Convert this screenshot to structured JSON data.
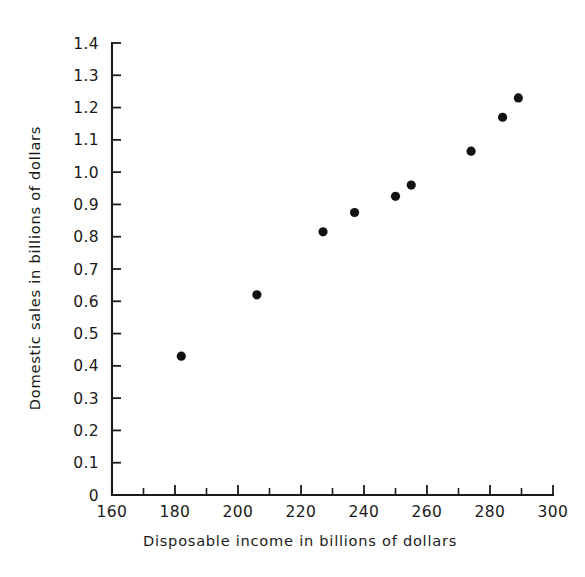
{
  "chart_data": {
    "type": "scatter",
    "title": "",
    "xlabel": "Disposable  income in billions of dollars",
    "ylabel": "Domestic sales in billions of dollars",
    "xlim": [
      160,
      300
    ],
    "ylim": [
      0,
      1.4
    ],
    "grid": false,
    "legend": null,
    "x_ticks_major": [
      160,
      180,
      200,
      220,
      240,
      260,
      280,
      300
    ],
    "x_tick_labels": [
      "160",
      "180",
      "200",
      "220",
      "240",
      "260",
      "280",
      "300"
    ],
    "x_ticks_minor": [
      170,
      190,
      210,
      230,
      250,
      270,
      290
    ],
    "y_ticks_major": [
      0,
      0.1,
      0.2,
      0.3,
      0.4,
      0.5,
      0.6,
      0.7,
      0.8,
      0.9,
      1.0,
      1.1,
      1.2,
      1.3,
      1.4
    ],
    "y_tick_labels": [
      "0",
      "0.1",
      "0.2",
      "0.3",
      "0.4",
      "0.5",
      "0.6",
      "0.7",
      "0.8",
      "0.9",
      "1.0",
      "1.1",
      "1.2",
      "1.3",
      "1.4"
    ],
    "points": [
      {
        "x": 182,
        "y": 0.43
      },
      {
        "x": 206,
        "y": 0.62
      },
      {
        "x": 227,
        "y": 0.815
      },
      {
        "x": 237,
        "y": 0.875
      },
      {
        "x": 250,
        "y": 0.925
      },
      {
        "x": 255,
        "y": 0.96
      },
      {
        "x": 274,
        "y": 1.065
      },
      {
        "x": 284,
        "y": 1.17
      },
      {
        "x": 289,
        "y": 1.23
      }
    ],
    "marker": {
      "shape": "circle",
      "size": 4.6,
      "color": "#121212"
    }
  },
  "colors": {
    "background": "#ffffff",
    "ink": "#1a1a1a",
    "marker": "#121212"
  }
}
